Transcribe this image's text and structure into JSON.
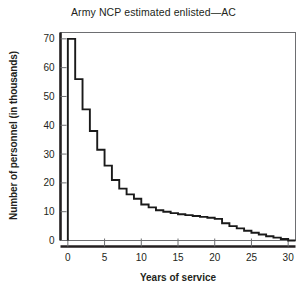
{
  "chart_data": {
    "type": "line",
    "title": "Army NCP estimated enlisted—AC",
    "xlabel": "Years of service",
    "ylabel": "Number of personnel (in thousands)",
    "xlim": [
      -1,
      31
    ],
    "ylim": [
      -2,
      73
    ],
    "xticks": [
      0,
      5,
      10,
      15,
      20,
      25,
      30
    ],
    "yticks": [
      0,
      10,
      20,
      30,
      40,
      50,
      60,
      70
    ],
    "xtick_labels": [
      "0",
      "5",
      "10",
      "15",
      "20",
      "25",
      "30"
    ],
    "ytick_labels": [
      "0",
      "10",
      "20",
      "30",
      "40",
      "50",
      "60",
      "70"
    ],
    "grid": false,
    "legend": false,
    "style": "step",
    "line_color": "#1a1a1a",
    "x": [
      0,
      1,
      2,
      3,
      4,
      5,
      6,
      7,
      8,
      9,
      10,
      11,
      12,
      13,
      14,
      15,
      16,
      17,
      18,
      19,
      20,
      21,
      22,
      23,
      24,
      25,
      26,
      27,
      28,
      29,
      30
    ],
    "values": [
      70,
      56,
      45.5,
      38,
      31.5,
      26,
      21,
      18,
      16,
      14.5,
      12.5,
      11.5,
      10.5,
      10,
      9.5,
      9.1,
      8.8,
      8.5,
      8.2,
      7.9,
      7.5,
      6,
      5,
      4.2,
      3.4,
      2.7,
      2.1,
      1.5,
      1,
      0.5,
      0
    ],
    "series": [
      {
        "name": "Army NCP estimated enlisted—AC",
        "values": [
          70,
          56,
          45.5,
          38,
          31.5,
          26,
          21,
          18,
          16,
          14.5,
          12.5,
          11.5,
          10.5,
          10,
          9.5,
          9.1,
          8.8,
          8.5,
          8.2,
          7.9,
          7.5,
          6,
          5,
          4.2,
          3.4,
          2.7,
          2.1,
          1.5,
          1,
          0.5,
          0
        ]
      }
    ]
  }
}
